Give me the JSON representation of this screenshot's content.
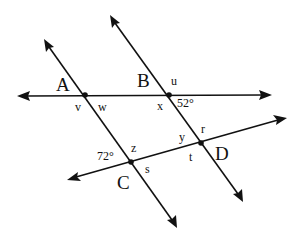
{
  "diagram": {
    "colors": {
      "ink": "#111111",
      "background": "#ffffff"
    },
    "lines": [
      {
        "name": "line-AB",
        "from": [
          17,
          96
        ],
        "to": [
          272,
          95
        ]
      },
      {
        "name": "line-CD",
        "from": [
          67,
          180
        ],
        "to": [
          287,
          118
        ]
      },
      {
        "name": "line-AC",
        "from": [
          44,
          39
        ],
        "to": [
          177,
          228
        ]
      },
      {
        "name": "line-BD",
        "from": [
          110,
          15
        ],
        "to": [
          243,
          202
        ]
      }
    ],
    "points": {
      "A": {
        "label": "A",
        "x": 85,
        "y": 95
      },
      "B": {
        "label": "B",
        "x": 169,
        "y": 95
      },
      "C": {
        "label": "C",
        "x": 131,
        "y": 162
      },
      "D": {
        "label": "D",
        "x": 201,
        "y": 143
      }
    },
    "angle_labels": {
      "u": "u",
      "v": "v",
      "w": "w",
      "x": "x",
      "y": "y",
      "z": "z",
      "r": "r",
      "s": "s",
      "t": "t",
      "angle_52": "52°",
      "angle_72": "72°"
    }
  }
}
